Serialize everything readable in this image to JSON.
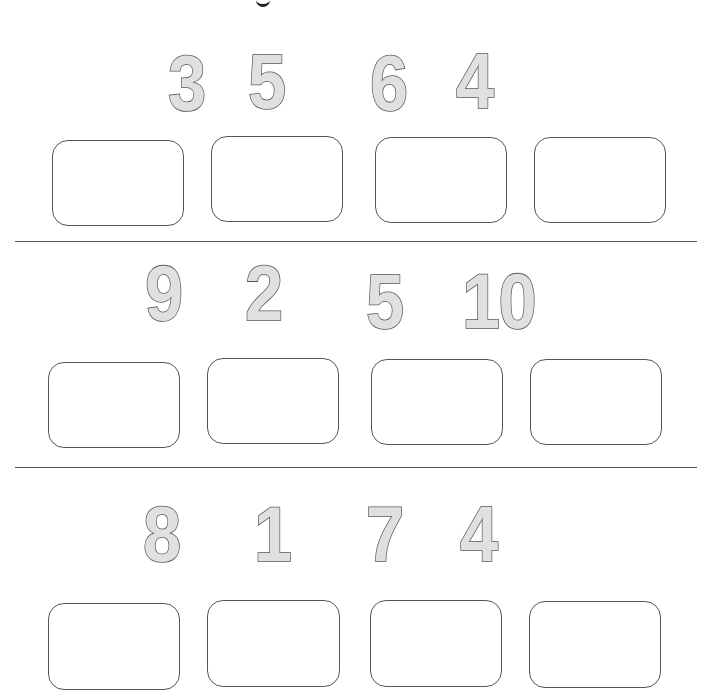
{
  "worksheet": {
    "title_fragment": "g",
    "rows": [
      {
        "numbers": [
          "3",
          "5",
          "6",
          "4"
        ],
        "answer_boxes": [
          "",
          "",
          "",
          ""
        ]
      },
      {
        "numbers": [
          "9",
          "2",
          "5",
          "10"
        ],
        "answer_boxes": [
          "",
          "",
          "",
          ""
        ]
      },
      {
        "numbers": [
          "8",
          "1",
          "7",
          "4"
        ],
        "answer_boxes": [
          "",
          "",
          "",
          ""
        ]
      }
    ]
  },
  "colors": {
    "number_fill": "#e0e0e0",
    "number_outline": "#555555",
    "box_border": "#555555",
    "divider": "#555555",
    "background": "#ffffff"
  }
}
